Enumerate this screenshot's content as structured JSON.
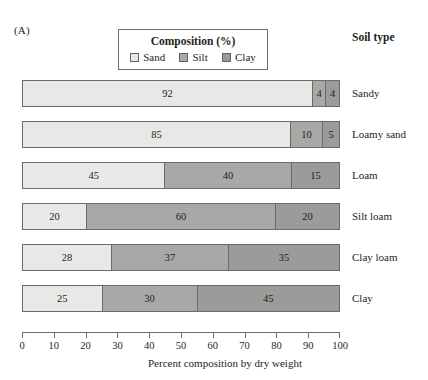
{
  "figure": {
    "panel_letter": "(A)",
    "soil_type_heading": "Soil type",
    "axis_title": "Percent composition by dry weight"
  },
  "legend": {
    "title": "Composition (%)",
    "items": [
      {
        "label": "Sand",
        "color": "#e8e8e6",
        "swatch_name": "legend-swatch-sand"
      },
      {
        "label": "Silt",
        "color": "#a8a8a6",
        "swatch_name": "legend-swatch-silt"
      },
      {
        "label": "Clay",
        "color": "#9b9b99",
        "swatch_name": "legend-swatch-clay"
      }
    ]
  },
  "chart_data": {
    "type": "bar",
    "orientation": "horizontal",
    "stacked": true,
    "title": "Composition (%)",
    "xlabel": "Percent composition by dry weight",
    "ylabel": "Soil type",
    "xlim": [
      0,
      100
    ],
    "xticks": [
      0,
      10,
      20,
      30,
      40,
      50,
      60,
      70,
      80,
      90,
      100
    ],
    "xticklabels": [
      "0",
      "10",
      "20",
      "30",
      "40",
      "50",
      "60",
      "70",
      "80",
      "90",
      "100"
    ],
    "grid": false,
    "legend_position": "top-center",
    "categories": [
      "Sandy",
      "Loamy sand",
      "Loam",
      "Silt loam",
      "Clay loam",
      "Clay"
    ],
    "series": [
      {
        "name": "Sand",
        "color": "#e8e8e6",
        "values": [
          92,
          85,
          45,
          20,
          28,
          25
        ]
      },
      {
        "name": "Silt",
        "color": "#a8a8a6",
        "values": [
          4,
          10,
          40,
          60,
          37,
          30
        ]
      },
      {
        "name": "Clay",
        "color": "#9b9b99",
        "values": [
          4,
          5,
          15,
          20,
          35,
          45
        ]
      }
    ],
    "rows": [
      {
        "label": "Sandy",
        "segments": [
          {
            "series": "Sand",
            "value": 92,
            "label": "92"
          },
          {
            "series": "Silt",
            "value": 4,
            "label": "4"
          },
          {
            "series": "Clay",
            "value": 4,
            "label": "4"
          }
        ]
      },
      {
        "label": "Loamy sand",
        "segments": [
          {
            "series": "Sand",
            "value": 85,
            "label": "85"
          },
          {
            "series": "Silt",
            "value": 10,
            "label": "10"
          },
          {
            "series": "Clay",
            "value": 5,
            "label": "5"
          }
        ]
      },
      {
        "label": "Loam",
        "segments": [
          {
            "series": "Sand",
            "value": 45,
            "label": "45"
          },
          {
            "series": "Silt",
            "value": 40,
            "label": "40"
          },
          {
            "series": "Clay",
            "value": 15,
            "label": "15"
          }
        ]
      },
      {
        "label": "Silt loam",
        "segments": [
          {
            "series": "Sand",
            "value": 20,
            "label": "20"
          },
          {
            "series": "Silt",
            "value": 60,
            "label": "60"
          },
          {
            "series": "Clay",
            "value": 20,
            "label": "20"
          }
        ]
      },
      {
        "label": "Clay loam",
        "segments": [
          {
            "series": "Sand",
            "value": 28,
            "label": "28"
          },
          {
            "series": "Silt",
            "value": 37,
            "label": "37"
          },
          {
            "series": "Clay",
            "value": 35,
            "label": "35"
          }
        ]
      },
      {
        "label": "Clay",
        "segments": [
          {
            "series": "Sand",
            "value": 25,
            "label": "25"
          },
          {
            "series": "Silt",
            "value": 30,
            "label": "30"
          },
          {
            "series": "Clay",
            "value": 45,
            "label": "45"
          }
        ]
      }
    ]
  },
  "style": {
    "bar_border": "#6b6b6b",
    "text_color": "#231f20",
    "background": "#ffffff"
  }
}
